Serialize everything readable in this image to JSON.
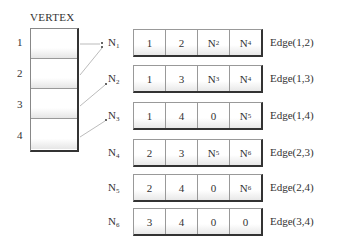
{
  "vertex": {
    "title": "VERTEX",
    "items": [
      "1",
      "2",
      "3",
      "4"
    ]
  },
  "records": [
    {
      "node": "N",
      "sub": "1",
      "cells": [
        {
          "t": "1"
        },
        {
          "t": "2"
        },
        {
          "t": "N",
          "s": "2"
        },
        {
          "t": "N",
          "s": "4"
        }
      ],
      "edge": "Edge(1,2)"
    },
    {
      "node": "N",
      "sub": "2",
      "cells": [
        {
          "t": "1"
        },
        {
          "t": "3"
        },
        {
          "t": "N",
          "s": "3"
        },
        {
          "t": "N",
          "s": "4"
        }
      ],
      "edge": "Edge(1,3)"
    },
    {
      "node": "N",
      "sub": "3",
      "cells": [
        {
          "t": "1"
        },
        {
          "t": "4"
        },
        {
          "t": "0"
        },
        {
          "t": "N",
          "s": "5"
        }
      ],
      "edge": "Edge(1,4)"
    },
    {
      "node": "N",
      "sub": "4",
      "cells": [
        {
          "t": "2"
        },
        {
          "t": "3"
        },
        {
          "t": "N",
          "s": "5"
        },
        {
          "t": "N",
          "s": "6"
        }
      ],
      "edge": "Edge(2,3)"
    },
    {
      "node": "N",
      "sub": "5",
      "cells": [
        {
          "t": "2"
        },
        {
          "t": "4"
        },
        {
          "t": "0"
        },
        {
          "t": "N",
          "s": "6"
        }
      ],
      "edge": "Edge(2,4)"
    },
    {
      "node": "N",
      "sub": "6",
      "cells": [
        {
          "t": "3"
        },
        {
          "t": "4"
        },
        {
          "t": "0"
        },
        {
          "t": "0"
        }
      ],
      "edge": "Edge(3,4)"
    }
  ],
  "colors": {
    "line": "#999999",
    "border": "#333333"
  }
}
